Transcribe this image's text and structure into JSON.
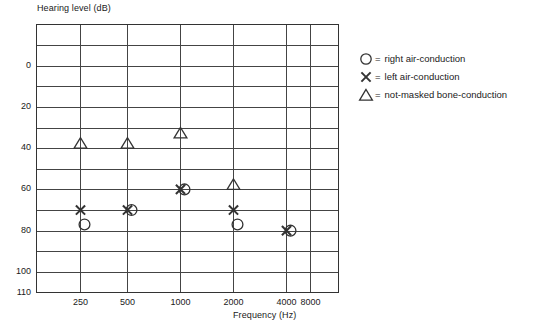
{
  "chart_data": {
    "type": "scatter",
    "title": "",
    "ylabel": "Hearing level (dB)",
    "xlabel": "Frequency (Hz)",
    "x_tick_labels": [
      "250",
      "500",
      "1000",
      "2000",
      "4000",
      "8000"
    ],
    "x_values": [
      250,
      500,
      1000,
      2000,
      4000,
      8000
    ],
    "y_tick_labels": [
      "0",
      "20",
      "40",
      "60",
      "80",
      "100",
      "110"
    ],
    "y_ticks": [
      0,
      20,
      40,
      60,
      80,
      100,
      110
    ],
    "ylim": [
      -20,
      110
    ],
    "y_gridlines": [
      -20,
      -10,
      0,
      10,
      20,
      30,
      40,
      50,
      60,
      70,
      80,
      90,
      100,
      110
    ],
    "y_axis_inverted": true,
    "grid": true,
    "legend_position": "right",
    "series": [
      {
        "name": "right air-conduction",
        "symbol": "circle",
        "points": [
          {
            "x": 250,
            "y": 77
          },
          {
            "x": 500,
            "y": 70
          },
          {
            "x": 1000,
            "y": 60
          },
          {
            "x": 2000,
            "y": 77
          },
          {
            "x": 4000,
            "y": 80
          }
        ]
      },
      {
        "name": "left air-conduction",
        "symbol": "x",
        "points": [
          {
            "x": 250,
            "y": 70
          },
          {
            "x": 500,
            "y": 70
          },
          {
            "x": 1000,
            "y": 60
          },
          {
            "x": 2000,
            "y": 70
          },
          {
            "x": 4000,
            "y": 80
          }
        ]
      },
      {
        "name": "not-masked bone-conduction",
        "symbol": "triangle",
        "points": [
          {
            "x": 250,
            "y": 40
          },
          {
            "x": 500,
            "y": 40
          },
          {
            "x": 1000,
            "y": 35
          },
          {
            "x": 2000,
            "y": 60
          }
        ]
      }
    ]
  },
  "legend": {
    "entries": [
      {
        "symbol": "circle",
        "equals": "=",
        "label": "right air-conduction"
      },
      {
        "symbol": "x",
        "equals": "=",
        "label": "left air-conduction"
      },
      {
        "symbol": "triangle",
        "equals": "=",
        "label": "not-masked bone-conduction"
      }
    ]
  },
  "colors": {
    "line": "#333333",
    "grid": "#444444",
    "text": "#1a1a1a",
    "background": "#ffffff"
  }
}
